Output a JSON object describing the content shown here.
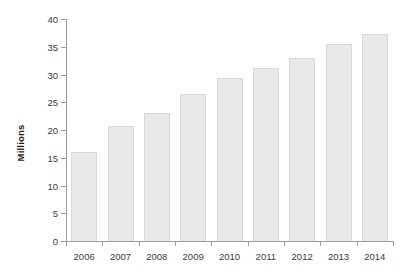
{
  "chart_data": {
    "type": "bar",
    "title": "",
    "xlabel": "",
    "ylabel": "Millions",
    "categories": [
      "2006",
      "2007",
      "2008",
      "2009",
      "2010",
      "2011",
      "2012",
      "2013",
      "2014"
    ],
    "values": [
      16.1,
      20.7,
      23.0,
      26.5,
      29.3,
      31.2,
      33.0,
      35.5,
      37.3
    ],
    "ylim": [
      0,
      40
    ],
    "ytick_step": 5,
    "ytick_labels": [
      "0",
      "5",
      "10",
      "15",
      "20",
      "25",
      "30",
      "35",
      "40"
    ],
    "grid": false,
    "legend": false,
    "legend_position": "none",
    "bar_color": "#e9e9e9",
    "bar_border_color": "#d8d8d8",
    "axis_color": "#9b9b9b",
    "text_color": "#3a3a3a",
    "background": "#ffffff"
  }
}
